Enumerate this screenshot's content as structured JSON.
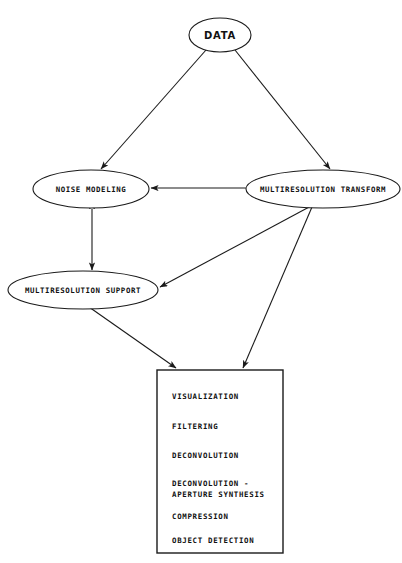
{
  "diagram": {
    "type": "flowchart",
    "title": "",
    "background_color": "#ffffff",
    "line_color": "#1a1a1a",
    "nodes": [
      {
        "id": "data",
        "label": "DATA",
        "shape": "ellipse",
        "cx": 220,
        "cy": 35,
        "rx": 31,
        "ry": 17
      },
      {
        "id": "noise-modeling",
        "label": "NOISE MODELING",
        "shape": "ellipse",
        "cx": 91,
        "cy": 189,
        "rx": 58,
        "ry": 19
      },
      {
        "id": "multiresolution-transform",
        "label": "MULTIRESOLUTION TRANSFORM",
        "shape": "ellipse",
        "cx": 323,
        "cy": 189,
        "rx": 77,
        "ry": 19
      },
      {
        "id": "multiresolution-support",
        "label": "MULTIRESOLUTION SUPPORT",
        "shape": "ellipse",
        "cx": 83,
        "cy": 290,
        "rx": 75,
        "ry": 19
      }
    ],
    "output_box": {
      "id": "applications-box",
      "shape": "rectangle",
      "x": 157,
      "y": 370,
      "width": 126,
      "height": 183,
      "items": [
        {
          "lines": [
            "VISUALIZATION"
          ]
        },
        {
          "lines": [
            "FILTERING"
          ]
        },
        {
          "lines": [
            "DECONVOLUTION"
          ]
        },
        {
          "lines": [
            "DECONVOLUTION -",
            "APERTURE SYNTHESIS"
          ]
        },
        {
          "lines": [
            "COMPRESSION"
          ]
        },
        {
          "lines": [
            "OBJECT DETECTION"
          ]
        }
      ]
    },
    "edges": [
      {
        "id": "data-to-noise-modeling",
        "from": "data",
        "to": "noise-modeling",
        "arrow": "single"
      },
      {
        "id": "data-to-multiresolution-transform",
        "from": "data",
        "to": "multiresolution-transform",
        "arrow": "single"
      },
      {
        "id": "transform-to-noise-modeling",
        "from": "multiresolution-transform",
        "to": "noise-modeling",
        "arrow": "single"
      },
      {
        "id": "noise-modeling-to-multiresolution-support",
        "from": "noise-modeling",
        "to": "multiresolution-support",
        "arrow": "double"
      },
      {
        "id": "transform-to-multiresolution-support",
        "from": "multiresolution-transform",
        "to": "multiresolution-support",
        "arrow": "single"
      },
      {
        "id": "multiresolution-support-to-box",
        "from": "multiresolution-support",
        "to": "applications-box",
        "arrow": "single"
      },
      {
        "id": "transform-to-box",
        "from": "multiresolution-transform",
        "to": "applications-box",
        "arrow": "single"
      }
    ]
  }
}
